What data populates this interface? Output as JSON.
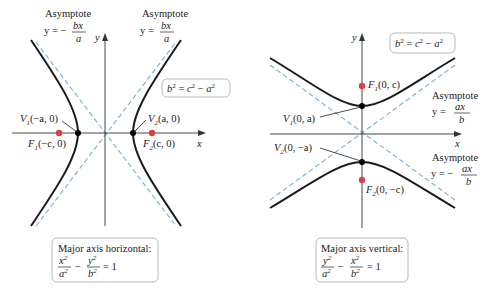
{
  "left_panel": {
    "asymptote_neg": {
      "title": "Asymptote",
      "eq_lhs": "y = −",
      "num": "bx",
      "den": "a"
    },
    "asymptote_pos": {
      "title": "Asymptote",
      "eq_lhs": "y =",
      "num": "bx",
      "den": "a"
    },
    "relation": {
      "b": "b",
      "eq": " = ",
      "c": "c",
      "minus": " − ",
      "a": "a",
      "exp": "2"
    },
    "axis_x": "x",
    "axis_y": "y",
    "v1": {
      "name": "V",
      "sub": "1",
      "coords": "(−a, 0)"
    },
    "v2": {
      "name": "V",
      "sub": "2",
      "coords": "(a, 0)"
    },
    "f1": {
      "name": "F",
      "sub": "1",
      "coords": "(−c, 0)"
    },
    "f2": {
      "name": "F",
      "sub": "2",
      "coords": "(c, 0)"
    },
    "caption": {
      "title": "Major axis horizontal:",
      "t1n": "x",
      "t1d": "a",
      "t2n": "y",
      "t2d": "b",
      "minus": "−",
      "rhs": "= 1",
      "exp": "2"
    }
  },
  "right_panel": {
    "asymptote_pos": {
      "title": "Asymptote",
      "eq_lhs": "y =",
      "num": "ax",
      "den": "b"
    },
    "asymptote_neg": {
      "title": "Asymptote",
      "eq_lhs": "y = −",
      "num": "ax",
      "den": "b"
    },
    "relation": {
      "b": "b",
      "eq": " = ",
      "c": "c",
      "minus": " − ",
      "a": "a",
      "exp": "2"
    },
    "axis_x": "x",
    "axis_y": "y",
    "v1": {
      "name": "V",
      "sub": "1",
      "coords": "(0, a)"
    },
    "v2": {
      "name": "V",
      "sub": "2",
      "coords": "(0, −a)"
    },
    "f1": {
      "name": "F",
      "sub": "1",
      "coords": "(0, c)"
    },
    "f2": {
      "name": "F",
      "sub": "2",
      "coords": "(0, −c)"
    },
    "caption": {
      "title": "Major axis vertical:",
      "t1n": "y",
      "t1d": "a",
      "t2n": "x",
      "t2d": "b",
      "minus": "−",
      "rhs": "= 1",
      "exp": "2"
    }
  },
  "colors": {
    "curve": "#1a1a1a",
    "axis": "#333333",
    "asymptote": "#7fb6d6",
    "focus": "#d9404a",
    "vertex": "#000000",
    "box_border": "#b0b0b0"
  }
}
